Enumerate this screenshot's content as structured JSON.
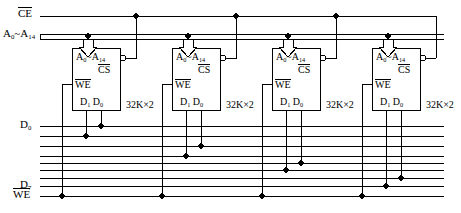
{
  "diagram": {
    "type": "digital-logic-schematic"
  },
  "bus_labels": {
    "chip_enable": "CE",
    "chip_enable_overline": true,
    "address_bus": "A",
    "address_low": "0",
    "address_tilde": "~",
    "address_high": "14",
    "data_first": "D",
    "data_first_index": "0",
    "data_last": "D",
    "data_last_index": "7",
    "write_enable": "WE",
    "write_enable_overline": true
  },
  "chips": [
    {
      "id": "chip-1",
      "address_label": "A",
      "addr_lo": "0",
      "addr_tilde": "~",
      "addr_hi": "14",
      "cs_label": "CS",
      "we_label": "WE",
      "d1_label": "D",
      "d1_index": "1",
      "d0_label": "D",
      "d0_index": "0",
      "capacity": "32K×2",
      "data_lines": [
        "D0",
        "D1"
      ]
    },
    {
      "id": "chip-2",
      "address_label": "A",
      "addr_lo": "0",
      "addr_tilde": "~",
      "addr_hi": "14",
      "cs_label": "CS",
      "we_label": "WE",
      "d1_label": "D",
      "d1_index": "1",
      "d0_label": "D",
      "d0_index": "0",
      "capacity": "32K×2",
      "data_lines": [
        "D2",
        "D3"
      ]
    },
    {
      "id": "chip-3",
      "address_label": "A",
      "addr_lo": "0",
      "addr_tilde": "~",
      "addr_hi": "14",
      "cs_label": "CS",
      "we_label": "WE",
      "d1_label": "D",
      "d1_index": "1",
      "d0_label": "D",
      "d0_index": "0",
      "capacity": "32K×2",
      "data_lines": [
        "D4",
        "D5"
      ]
    },
    {
      "id": "chip-4",
      "address_label": "A",
      "addr_lo": "0",
      "addr_tilde": "~",
      "addr_hi": "14",
      "cs_label": "CS",
      "we_label": "WE",
      "d1_label": "D",
      "d1_index": "1",
      "d0_label": "D",
      "d0_index": "0",
      "capacity": "32K×2",
      "data_lines": [
        "D6",
        "D7"
      ]
    }
  ],
  "colors": {
    "wire": "#000000",
    "bus_fill": "#b4b4b4",
    "background": "#ffffff",
    "box_stroke": "#000000"
  },
  "counts": {
    "chip_count": 4,
    "data_line_count": 8,
    "address_line_count": 15
  }
}
